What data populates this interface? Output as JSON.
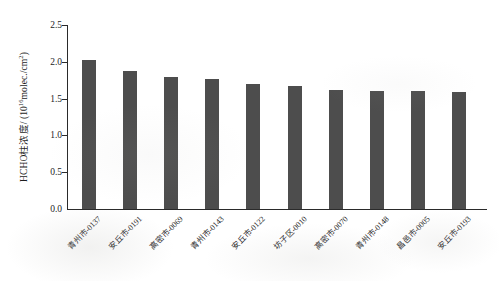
{
  "chart_data": {
    "type": "bar",
    "title": "",
    "xlabel": "",
    "ylabel": "HCHO柱浓度/ (10¹⁶molec./cm²)",
    "ylabel_prefix": "HCHO柱浓度/ (10",
    "ylabel_exponent": "16",
    "ylabel_suffix": "molec./cm",
    "ylabel_suffix_exponent": "2",
    "ylabel_close": ")",
    "categories": [
      "青州市-0137",
      "安丘市-0191",
      "高密市-0069",
      "青州市-0143",
      "安丘市-0122",
      "坊子区-0010",
      "高密市-0070",
      "青州市-0148",
      "昌邑市-0005",
      "安丘市-0193"
    ],
    "values": [
      2.02,
      1.87,
      1.8,
      1.77,
      1.7,
      1.67,
      1.62,
      1.61,
      1.6,
      1.59
    ],
    "ylim": [
      0.0,
      2.5
    ],
    "ytick_labels": [
      "2.5",
      "2.0",
      "1.5",
      "1.0",
      "0.5",
      "0.0"
    ],
    "ytick_values": [
      2.5,
      2.0,
      1.5,
      1.0,
      0.5,
      0.0
    ],
    "grid": false,
    "legend": false,
    "bar_color": "#4d4d4d",
    "axis_color": "#2a2a2a",
    "text_color": "#1d1d1d",
    "background": "#ffffff"
  }
}
